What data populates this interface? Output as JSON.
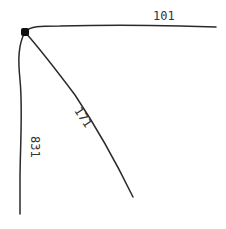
{
  "diagram": {
    "type": "graph",
    "nodes": [
      {
        "id": "root",
        "shape": "filled-square-dot"
      }
    ],
    "edges": [
      {
        "id": "edge-right",
        "from": "root",
        "direction": "right",
        "label": "101"
      },
      {
        "id": "edge-diagonal",
        "from": "root",
        "direction": "down-right",
        "label": "171"
      },
      {
        "id": "edge-down",
        "from": "root",
        "direction": "down",
        "label": "831"
      }
    ]
  },
  "colors": {
    "edge": "#2a2a2a",
    "node": "#111111",
    "label": "#333333",
    "background": "#ffffff"
  }
}
